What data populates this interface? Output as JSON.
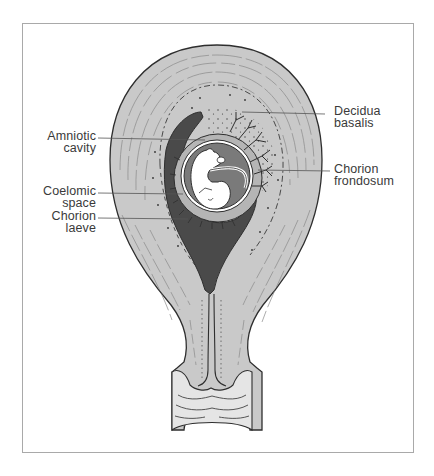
{
  "figure": {
    "colors": {
      "uterine_wall": "#c8c8c8",
      "outline": "#2e2e2e",
      "dark_cavity": "#4a4a4a",
      "amniotic_fluid": "#7a7a7a",
      "embryo": "#ffffff",
      "leader_line": "#555555",
      "frame_border": "#a9a9a9"
    }
  },
  "labels": {
    "amniotic_cavity": {
      "line1": "Amniotic",
      "line2": "cavity"
    },
    "coelomic_space": {
      "line1": "Coelomic",
      "line2": "space"
    },
    "chorion_laeve": {
      "line1": "Chorion",
      "line2": "laeve"
    },
    "decidua_basalis": {
      "line1": "Decidua",
      "line2": "basalis"
    },
    "chorion_frondosum": {
      "line1": "Chorion",
      "line2": "frondosum"
    }
  }
}
